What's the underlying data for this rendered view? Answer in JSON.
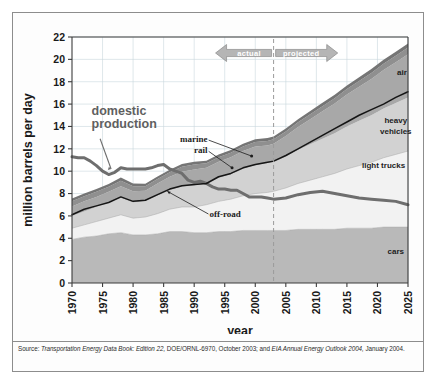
{
  "figure": {
    "axis_titles": {
      "y": "million barrels per day",
      "x": "year"
    },
    "source_prefix": "Source:",
    "source_line1_italic_a": "Transportation Energy Data Book: Edition 22,",
    "source_line1_plain_a": "DOE/ORNL-6970, October 2003; and",
    "source_line1_italic_b": "EIA Annual Energy Outlook",
    "source_line2_italic": "2004,",
    "source_line2_plain": "January 2004."
  },
  "annotations": {
    "actual": "actual",
    "projected": "projected",
    "domestic_production": "domestic\nproduction",
    "domestic_production_l1": "domestic",
    "domestic_production_l2": "production",
    "marine": "marine",
    "rail": "rail",
    "off_road": "off-road",
    "air": "air",
    "heavy_vehicles_l1": "heavy",
    "heavy_vehicles_l2": "vehicles",
    "light_trucks": "light trucks",
    "cars": "cars"
  },
  "colors": {
    "cars_band": "#b9b9b9",
    "light_trucks_band": "#f2f2f2",
    "heavy_vehicles_band": "#d2d2d2",
    "air_band": "#a8a8a8",
    "marine_band": "#8f8f8f",
    "rail_band": "#757575",
    "off_road_line": "#151515",
    "domestic_production_line": "#6e6e6e",
    "total_highway_line": "#6b6b6b",
    "plot_background": "#ffffff",
    "gridline": "#c9d7de",
    "axis": "#3c3c3c",
    "divider_dashed": "#9a9a9a",
    "arrow_fill": "#b5b5b5",
    "frame": "#8d8d8d"
  },
  "chart_data": {
    "type": "area",
    "title": "",
    "subtitle": "",
    "xlabel": "year",
    "ylabel": "million barrels per day",
    "xlim": [
      1970,
      2025
    ],
    "ylim": [
      0,
      22
    ],
    "ytick_labels": [
      "0",
      "2",
      "4",
      "6",
      "8",
      "10",
      "12",
      "14",
      "16",
      "18",
      "20",
      "22"
    ],
    "yticks": [
      0,
      2,
      4,
      6,
      8,
      10,
      12,
      14,
      16,
      18,
      20,
      22
    ],
    "xtick_labels": [
      "1970",
      "1975",
      "1980",
      "1985",
      "1990",
      "1995",
      "2000",
      "2005",
      "2010",
      "2015",
      "2020",
      "2025"
    ],
    "xticks": [
      1970,
      1975,
      1980,
      1985,
      1990,
      1995,
      2000,
      2005,
      2010,
      2015,
      2020,
      2025
    ],
    "grid": true,
    "legend_position": "inline-right-labels",
    "divider_year": 2003,
    "divider_style": "dashed",
    "x": [
      1970,
      1972,
      1974,
      1976,
      1978,
      1980,
      1982,
      1984,
      1986,
      1988,
      1990,
      1992,
      1994,
      1996,
      1998,
      2000,
      2002,
      2003,
      2005,
      2007,
      2009,
      2011,
      2013,
      2015,
      2017,
      2019,
      2021,
      2023,
      2025
    ],
    "stack_order": [
      "cars",
      "light trucks",
      "heavy vehicles",
      "air",
      "marine",
      "rail"
    ],
    "series": [
      {
        "name": "cars",
        "values": [
          3.9,
          4.1,
          4.2,
          4.4,
          4.5,
          4.3,
          4.3,
          4.4,
          4.6,
          4.6,
          4.5,
          4.5,
          4.6,
          4.6,
          4.7,
          4.7,
          4.7,
          4.7,
          4.7,
          4.8,
          4.8,
          4.8,
          4.8,
          4.9,
          4.9,
          4.9,
          5.0,
          5.0,
          5.0
        ]
      },
      {
        "name": "light trucks",
        "values": [
          1.0,
          1.1,
          1.3,
          1.4,
          1.6,
          1.5,
          1.6,
          1.8,
          2.0,
          2.2,
          2.3,
          2.5,
          2.7,
          2.9,
          3.1,
          3.3,
          3.4,
          3.5,
          3.8,
          4.1,
          4.4,
          4.7,
          5.0,
          5.3,
          5.6,
          5.9,
          6.2,
          6.5,
          6.8
        ]
      },
      {
        "name": "heavy vehicles",
        "values": [
          1.1,
          1.2,
          1.3,
          1.4,
          1.5,
          1.4,
          1.4,
          1.6,
          1.7,
          1.8,
          1.9,
          1.9,
          2.1,
          2.2,
          2.4,
          2.5,
          2.6,
          2.6,
          2.8,
          3.0,
          3.2,
          3.4,
          3.6,
          3.8,
          4.0,
          4.2,
          4.4,
          4.6,
          4.8
        ]
      },
      {
        "name": "air",
        "values": [
          0.85,
          0.9,
          0.9,
          0.95,
          1.05,
          1.0,
          0.95,
          1.1,
          1.2,
          1.35,
          1.45,
          1.4,
          1.45,
          1.55,
          1.6,
          1.7,
          1.6,
          1.65,
          1.85,
          2.05,
          2.25,
          2.45,
          2.65,
          2.85,
          3.05,
          3.25,
          3.45,
          3.65,
          3.85
        ]
      },
      {
        "name": "marine",
        "values": [
          0.45,
          0.45,
          0.45,
          0.45,
          0.5,
          0.45,
          0.4,
          0.4,
          0.4,
          0.45,
          0.45,
          0.4,
          0.4,
          0.4,
          0.4,
          0.4,
          0.4,
          0.4,
          0.4,
          0.42,
          0.44,
          0.46,
          0.48,
          0.5,
          0.52,
          0.54,
          0.56,
          0.58,
          0.6
        ]
      },
      {
        "name": "rail",
        "values": [
          0.25,
          0.25,
          0.25,
          0.25,
          0.28,
          0.25,
          0.22,
          0.22,
          0.22,
          0.24,
          0.25,
          0.24,
          0.24,
          0.25,
          0.25,
          0.26,
          0.26,
          0.26,
          0.27,
          0.28,
          0.29,
          0.3,
          0.31,
          0.32,
          0.33,
          0.34,
          0.35,
          0.36,
          0.37
        ]
      }
    ],
    "lines": [
      {
        "name": "domestic production",
        "x": [
          1970,
          1971,
          1972,
          1973,
          1974,
          1975,
          1976,
          1977,
          1978,
          1979,
          1980,
          1981,
          1982,
          1983,
          1984,
          1985,
          1986,
          1987,
          1988,
          1989,
          1990,
          1991,
          1992,
          1993,
          1994,
          1995,
          1996,
          1997,
          1998,
          1999,
          2000,
          2001,
          2002,
          2003,
          2005,
          2007,
          2009,
          2011,
          2013,
          2015,
          2017,
          2019,
          2021,
          2023,
          2025
        ],
        "values": [
          11.3,
          11.2,
          11.2,
          10.9,
          10.5,
          10.0,
          9.7,
          9.9,
          10.3,
          10.2,
          10.2,
          10.2,
          10.2,
          10.3,
          10.5,
          10.6,
          10.2,
          10.0,
          9.8,
          9.2,
          9.0,
          9.1,
          8.9,
          8.6,
          8.4,
          8.4,
          8.3,
          8.3,
          8.0,
          7.7,
          7.7,
          7.7,
          7.6,
          7.5,
          7.6,
          7.9,
          8.1,
          8.2,
          8.0,
          7.8,
          7.6,
          7.5,
          7.4,
          7.3,
          7.0
        ]
      },
      {
        "name": "off-road",
        "x": [
          1970,
          1972,
          1974,
          1976,
          1978,
          1980,
          1982,
          1984,
          1986,
          1988,
          1990,
          1992,
          1994,
          1996,
          1998,
          2000,
          2002,
          2003,
          2005,
          2007,
          2009,
          2011,
          2013,
          2015,
          2017,
          2019,
          2021,
          2023,
          2025
        ],
        "values": [
          6.1,
          6.6,
          6.9,
          7.2,
          7.7,
          7.3,
          7.4,
          7.9,
          8.4,
          8.7,
          8.8,
          8.9,
          9.5,
          9.8,
          10.3,
          10.6,
          10.8,
          10.9,
          11.4,
          12.0,
          12.6,
          13.2,
          13.8,
          14.4,
          15.0,
          15.5,
          16.0,
          16.6,
          17.1
        ]
      }
    ],
    "band_labels": [
      {
        "text": "air",
        "year": 2024,
        "value": 18.6
      },
      {
        "text": "heavy vehicles",
        "year": 2023,
        "value": 14.3
      },
      {
        "text": "light trucks",
        "year": 2021,
        "value": 10.3
      },
      {
        "text": "cars",
        "year": 2023,
        "value": 2.6
      }
    ],
    "callouts": [
      {
        "text": "domestic production",
        "year": 1974,
        "value": 14.5
      },
      {
        "text": "marine",
        "year": 1995,
        "value": 12.3
      },
      {
        "text": "rail",
        "year": 1995,
        "value": 11.4
      },
      {
        "text": "off-road",
        "year": 1993,
        "value": 6.1
      }
    ]
  }
}
